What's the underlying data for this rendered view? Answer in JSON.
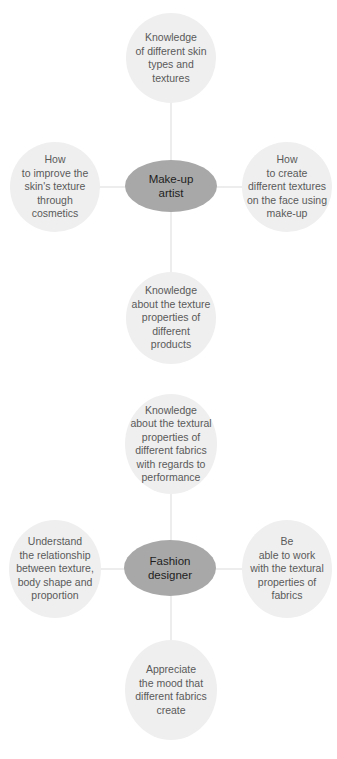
{
  "diagrams": [
    {
      "hub": "Make-up\nartist",
      "top": "Knowledge\nof different skin\ntypes and\ntextures",
      "left": "How\nto improve the\nskin's texture\nthrough\ncosmetics",
      "right": "How\nto create\ndifferent textures\non the face using\nmake-up",
      "bottom": "Knowledge\nabout the texture\nproperties of\ndifferent\nproducts"
    },
    {
      "hub": "Fashion\ndesigner",
      "top": "Knowledge\nabout the textural\nproperties of\ndifferent fabrics\nwith regards to\nperformance",
      "left": "Understand\nthe relationship\nbetween texture,\nbody shape and\nproportion",
      "right": "Be\nable to work\nwith the textural\nproperties of\nfabrics",
      "bottom": "Appreciate\nthe mood that\ndifferent fabrics\ncreate"
    }
  ],
  "colors": {
    "hub_fill": "#a8a8a8",
    "bubble_fill": "#efefef",
    "connector": "#ededed",
    "text": "#5a5a5a"
  }
}
